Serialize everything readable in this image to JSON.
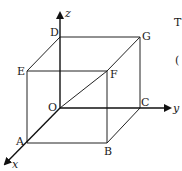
{
  "diagram": {
    "type": "3d-cube-coordinate-axes",
    "axes": [
      {
        "name": "x",
        "label": "x"
      },
      {
        "name": "y",
        "label": "y"
      },
      {
        "name": "z",
        "label": "z"
      }
    ],
    "vertices": {
      "O": {
        "label": "O",
        "x": 60,
        "y": 108
      },
      "A": {
        "label": "A",
        "x": 27,
        "y": 143
      },
      "B": {
        "label": "B",
        "x": 107,
        "y": 143
      },
      "C": {
        "label": "C",
        "x": 140,
        "y": 108
      },
      "D": {
        "label": "D",
        "x": 60,
        "y": 37
      },
      "E": {
        "label": "E",
        "x": 27,
        "y": 71
      },
      "F": {
        "label": "F",
        "x": 107,
        "y": 71
      },
      "G": {
        "label": "G",
        "x": 140,
        "y": 37
      }
    },
    "edges": [
      [
        "A",
        "B"
      ],
      [
        "B",
        "C"
      ],
      [
        "A",
        "E"
      ],
      [
        "B",
        "F"
      ],
      [
        "C",
        "G"
      ],
      [
        "D",
        "E"
      ],
      [
        "D",
        "G"
      ],
      [
        "E",
        "F"
      ],
      [
        "F",
        "G"
      ],
      [
        "O",
        "F"
      ]
    ],
    "cropped_text": {
      "line1": "T",
      "line2": "("
    }
  }
}
